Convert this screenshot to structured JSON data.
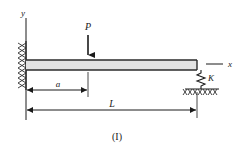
{
  "figure": {
    "caption": "(I)",
    "type": "beam-free-body-diagram"
  },
  "axes": {
    "y_label": "y",
    "x_label": "x"
  },
  "loads": [
    {
      "name": "point-load",
      "label": "P",
      "direction": "down"
    }
  ],
  "supports": [
    {
      "name": "fixed-support",
      "label": "",
      "position": "left"
    },
    {
      "name": "spring-support",
      "label": "K",
      "position": "right"
    },
    {
      "name": "ground",
      "label": "",
      "position": "right-bottom"
    }
  ],
  "dimensions": [
    {
      "name": "dimension-a",
      "label": "a"
    },
    {
      "name": "dimension-L",
      "label": "L"
    }
  ],
  "colors": {
    "line": "#1a1a1a",
    "beam_fill": "#e3e3e3",
    "beam_edge": "#2b2b2b",
    "hatch": "#303030",
    "background": "#ffffff"
  }
}
